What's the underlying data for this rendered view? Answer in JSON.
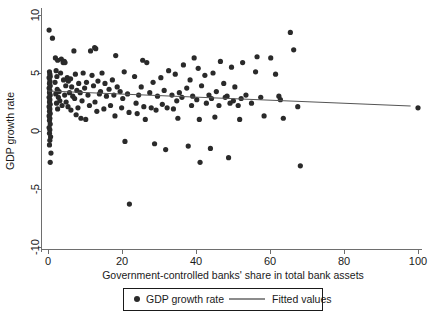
{
  "chart_data": {
    "type": "scatter",
    "title": "",
    "xlabel": "Government-controlled banks' share in total bank assets",
    "ylabel": "GDP growth rate",
    "xlim": [
      -2,
      103
    ],
    "ylim": [
      -10.8,
      11.0
    ],
    "xticks": [
      0,
      20,
      40,
      60,
      80,
      100
    ],
    "yticks": [
      -10,
      -5,
      0,
      5,
      10
    ],
    "xtick_labels": [
      "0",
      "20",
      "40",
      "60",
      "80",
      "100"
    ],
    "ytick_labels": [
      "-10",
      "-5",
      "0",
      "5",
      "10"
    ],
    "grid": false,
    "legend_position": "below-axis",
    "series": [
      {
        "name": "GDP growth rate",
        "type": "scatter",
        "marker": "filled-circle",
        "color": "#2a2a2a",
        "points": [
          [
            0.3,
            8.7
          ],
          [
            1.2,
            8.0
          ],
          [
            0.4,
            5.1
          ],
          [
            0.5,
            4.9
          ],
          [
            0.6,
            4.7
          ],
          [
            0.3,
            4.6
          ],
          [
            0.5,
            4.3
          ],
          [
            0.4,
            4.1
          ],
          [
            0.6,
            3.9
          ],
          [
            0.3,
            3.7
          ],
          [
            0.5,
            3.5
          ],
          [
            0.4,
            3.3
          ],
          [
            0.6,
            3.1
          ],
          [
            0.3,
            2.9
          ],
          [
            0.5,
            2.7
          ],
          [
            0.4,
            2.5
          ],
          [
            0.6,
            2.3
          ],
          [
            0.3,
            2.1
          ],
          [
            0.5,
            1.9
          ],
          [
            0.4,
            1.7
          ],
          [
            0.6,
            1.5
          ],
          [
            0.3,
            1.3
          ],
          [
            0.5,
            1.1
          ],
          [
            0.4,
            0.9
          ],
          [
            0.6,
            0.6
          ],
          [
            0.3,
            0.3
          ],
          [
            0.5,
            0.1
          ],
          [
            0.4,
            -0.2
          ],
          [
            0.7,
            -0.5
          ],
          [
            0.5,
            -0.8
          ],
          [
            0.4,
            -1.2
          ],
          [
            0.8,
            -1.9
          ],
          [
            0.6,
            -2.7
          ],
          [
            2.0,
            6.3
          ],
          [
            2.6,
            6.1
          ],
          [
            2.2,
            5.2
          ],
          [
            2.4,
            4.7
          ],
          [
            1.9,
            4.2
          ],
          [
            2.5,
            3.6
          ],
          [
            2.1,
            3.2
          ],
          [
            2.8,
            2.9
          ],
          [
            2.3,
            2.4
          ],
          [
            2.6,
            1.9
          ],
          [
            3.0,
            3.4
          ],
          [
            3.4,
            5.0
          ],
          [
            3.6,
            6.2
          ],
          [
            3.2,
            2.6
          ],
          [
            3.8,
            2.2
          ],
          [
            4.1,
            5.9
          ],
          [
            4.4,
            6.0
          ],
          [
            4.6,
            5.9
          ],
          [
            4.2,
            4.4
          ],
          [
            4.8,
            3.9
          ],
          [
            4.5,
            3.1
          ],
          [
            4.9,
            2.5
          ],
          [
            5.2,
            4.6
          ],
          [
            5.5,
            4.3
          ],
          [
            5.8,
            3.3
          ],
          [
            5.4,
            2.1
          ],
          [
            6.1,
            4.5
          ],
          [
            6.4,
            3.8
          ],
          [
            6.7,
            3.0
          ],
          [
            6.2,
            1.8
          ],
          [
            7.0,
            6.9
          ],
          [
            7.4,
            4.9
          ],
          [
            7.8,
            3.5
          ],
          [
            7.2,
            2.8
          ],
          [
            7.6,
            1.4
          ],
          [
            8.3,
            4.1
          ],
          [
            8.7,
            3.3
          ],
          [
            8.1,
            2.0
          ],
          [
            8.9,
            1.1
          ],
          [
            9.5,
            5.0
          ],
          [
            9.9,
            3.7
          ],
          [
            9.2,
            2.6
          ],
          [
            10.4,
            4.2
          ],
          [
            10.8,
            3.1
          ],
          [
            10.2,
            1.0
          ],
          [
            11.5,
            6.9
          ],
          [
            11.9,
            4.8
          ],
          [
            11.2,
            2.2
          ],
          [
            12.6,
            7.2
          ],
          [
            12.9,
            7.1
          ],
          [
            12.3,
            3.9
          ],
          [
            12.7,
            2.5
          ],
          [
            13.5,
            4.3
          ],
          [
            13.9,
            3.2
          ],
          [
            13.2,
            1.7
          ],
          [
            14.6,
            5.0
          ],
          [
            14.2,
            3.4
          ],
          [
            15.4,
            4.1
          ],
          [
            15.8,
            3.0
          ],
          [
            15.1,
            1.9
          ],
          [
            16.5,
            3.6
          ],
          [
            16.9,
            2.2
          ],
          [
            17.4,
            4.4
          ],
          [
            17.8,
            3.1
          ],
          [
            18.3,
            6.5
          ],
          [
            18.7,
            3.8
          ],
          [
            18.1,
            1.3
          ],
          [
            19.5,
            3.4
          ],
          [
            19.9,
            2.0
          ],
          [
            20.6,
            5.1
          ],
          [
            20.2,
            2.8
          ],
          [
            20.8,
            -0.9
          ],
          [
            21.5,
            3.2
          ],
          [
            21.9,
            1.6
          ],
          [
            22.0,
            -6.3
          ],
          [
            23.4,
            4.7
          ],
          [
            23.8,
            2.4
          ],
          [
            24.5,
            3.1
          ],
          [
            24.1,
            1.5
          ],
          [
            25.6,
            6.1
          ],
          [
            25.2,
            3.8
          ],
          [
            25.9,
            2.1
          ],
          [
            26.7,
            5.9
          ],
          [
            26.3,
            1.0
          ],
          [
            27.5,
            3.3
          ],
          [
            27.9,
            2.0
          ],
          [
            28.4,
            4.2
          ],
          [
            28.8,
            -1.1
          ],
          [
            29.6,
            3.0
          ],
          [
            29.2,
            1.8
          ],
          [
            30.5,
            4.6
          ],
          [
            30.9,
            2.3
          ],
          [
            31.4,
            3.5
          ],
          [
            31.8,
            -1.6
          ],
          [
            32.6,
            5.2
          ],
          [
            32.2,
            2.0
          ],
          [
            33.5,
            3.1
          ],
          [
            33.9,
            1.9
          ],
          [
            34.4,
            4.9
          ],
          [
            34.8,
            2.6
          ],
          [
            35.5,
            3.3
          ],
          [
            35.1,
            1.1
          ],
          [
            36.6,
            5.7
          ],
          [
            36.2,
            2.9
          ],
          [
            37.5,
            3.7
          ],
          [
            37.9,
            -1.3
          ],
          [
            38.4,
            4.4
          ],
          [
            38.8,
            2.2
          ],
          [
            39.5,
            6.3
          ],
          [
            39.1,
            3.0
          ],
          [
            40.6,
            5.4
          ],
          [
            40.2,
            2.7
          ],
          [
            40.9,
            1.0
          ],
          [
            41.5,
            3.9
          ],
          [
            41.1,
            -2.7
          ],
          [
            42.4,
            4.8
          ],
          [
            42.8,
            2.4
          ],
          [
            43.5,
            3.1
          ],
          [
            43.9,
            -1.5
          ],
          [
            44.6,
            5.0
          ],
          [
            44.2,
            2.8
          ],
          [
            45.5,
            3.4
          ],
          [
            45.1,
            1.2
          ],
          [
            46.6,
            6.0
          ],
          [
            46.2,
            2.2
          ],
          [
            47.5,
            4.1
          ],
          [
            47.9,
            2.9
          ],
          [
            48.4,
            3.0
          ],
          [
            48.8,
            -2.3
          ],
          [
            49.6,
            5.5
          ],
          [
            49.2,
            2.4
          ],
          [
            50.5,
            3.8
          ],
          [
            50.1,
            2.6
          ],
          [
            51.4,
            2.2
          ],
          [
            51.8,
            1.0
          ],
          [
            52.6,
            5.9
          ],
          [
            52.2,
            2.8
          ],
          [
            53.5,
            3.1
          ],
          [
            55.0,
            2.4
          ],
          [
            56.5,
            6.4
          ],
          [
            56.1,
            5.1
          ],
          [
            57.5,
            2.9
          ],
          [
            58.4,
            1.3
          ],
          [
            60.2,
            6.3
          ],
          [
            61.5,
            4.9
          ],
          [
            62.4,
            3.0
          ],
          [
            62.8,
            2.7
          ],
          [
            63.6,
            1.1
          ],
          [
            65.5,
            8.5
          ],
          [
            66.4,
            7.0
          ],
          [
            67.5,
            2.1
          ],
          [
            68.2,
            -3.0
          ],
          [
            100.0,
            2.0
          ]
        ]
      },
      {
        "name": "Fitted values",
        "type": "line",
        "color": "#555555",
        "x_range": [
          0,
          98
        ],
        "y_at_x_start": 3.45,
        "y_at_x_end": 2.15,
        "slope": -0.0133,
        "intercept": 3.45
      }
    ],
    "legend_entries": [
      {
        "label": "GDP growth rate",
        "marker": "filled-circle"
      },
      {
        "label": "Fitted values",
        "marker": "line"
      }
    ]
  }
}
